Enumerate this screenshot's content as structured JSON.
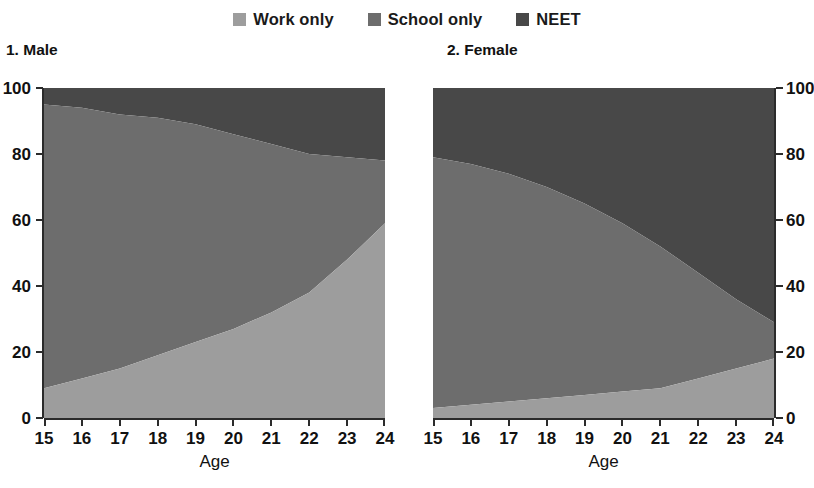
{
  "legend": {
    "items": [
      {
        "label": "Work only",
        "color": "#9d9d9d",
        "key": "work_only"
      },
      {
        "label": "School only",
        "color": "#6d6d6d",
        "key": "school_only"
      },
      {
        "label": "NEET",
        "color": "#484848",
        "key": "neet"
      }
    ]
  },
  "panels": [
    {
      "id": "male",
      "title": "1. Male",
      "axis_side": "left"
    },
    {
      "id": "female",
      "title": "2. Female",
      "axis_side": "right"
    }
  ],
  "axes": {
    "y_ticks": [
      "0",
      "20",
      "40",
      "60",
      "80",
      "100"
    ],
    "x_ticks": [
      "15",
      "16",
      "17",
      "18",
      "19",
      "20",
      "21",
      "22",
      "23",
      "24"
    ],
    "x_title": "Age",
    "y_min": 0,
    "y_max": 100
  },
  "colors": {
    "work_only": "#9d9d9d",
    "school_only": "#6d6d6d",
    "neet": "#484848",
    "axis": "#2b2b2b",
    "text": "#111111",
    "background": "#ffffff"
  },
  "chart_data": [
    {
      "type": "area",
      "title": "1. Male",
      "stacked": true,
      "xlabel": "Age",
      "ylabel": "",
      "ylim": [
        0,
        100
      ],
      "grid": false,
      "legend_position": "top-center",
      "x": [
        15,
        16,
        17,
        18,
        19,
        20,
        21,
        22,
        23,
        24
      ],
      "categories": [
        "15",
        "16",
        "17",
        "18",
        "19",
        "20",
        "21",
        "22",
        "23",
        "24"
      ],
      "series": [
        {
          "name": "Work only",
          "values": [
            9,
            12,
            15,
            19,
            23,
            27,
            32,
            38,
            48,
            59
          ]
        },
        {
          "name": "School only",
          "values": [
            86,
            82,
            77,
            72,
            66,
            59,
            51,
            42,
            31,
            19
          ]
        },
        {
          "name": "NEET",
          "values": [
            5,
            6,
            8,
            9,
            11,
            14,
            17,
            20,
            21,
            22
          ]
        }
      ],
      "cumulative_upper_bounds": {
        "work_only": [
          9,
          12,
          15,
          19,
          23,
          27,
          32,
          38,
          48,
          59
        ],
        "work_plus_school": [
          95,
          94,
          92,
          91,
          89,
          86,
          83,
          80,
          79,
          78
        ]
      }
    },
    {
      "type": "area",
      "title": "2. Female",
      "stacked": true,
      "xlabel": "Age",
      "ylabel": "",
      "ylim": [
        0,
        100
      ],
      "grid": false,
      "legend_position": "top-center",
      "x": [
        15,
        16,
        17,
        18,
        19,
        20,
        21,
        22,
        23,
        24
      ],
      "categories": [
        "15",
        "16",
        "17",
        "18",
        "19",
        "20",
        "21",
        "22",
        "23",
        "24"
      ],
      "series": [
        {
          "name": "Work only",
          "values": [
            3,
            4,
            5,
            6,
            7,
            8,
            9,
            12,
            15,
            18
          ]
        },
        {
          "name": "School only",
          "values": [
            76,
            73,
            69,
            64,
            58,
            51,
            43,
            32,
            21,
            11
          ]
        },
        {
          "name": "NEET",
          "values": [
            21,
            23,
            26,
            30,
            35,
            41,
            48,
            56,
            64,
            71
          ]
        }
      ],
      "cumulative_upper_bounds": {
        "work_only": [
          3,
          4,
          5,
          6,
          7,
          8,
          9,
          12,
          15,
          18
        ],
        "work_plus_school": [
          79,
          77,
          74,
          70,
          65,
          59,
          52,
          44,
          36,
          29
        ]
      }
    }
  ]
}
